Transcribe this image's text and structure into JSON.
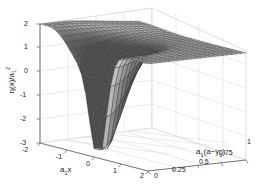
{
  "figure": {
    "kind": "3d-surface-plot",
    "background_color": "#ffffff",
    "grid_color": "#d9d9d9",
    "axis_color": "#808080",
    "mesh_color": "#3a3a3a",
    "surface_fill_light": "#e8e8e8",
    "surface_fill_dark": "#6e6e6e"
  },
  "chart_data": {
    "type": "surface",
    "title": "",
    "xlabel_parts": {
      "base": "a",
      "sub": "1",
      "tail": "x"
    },
    "xlabel": "a₁x",
    "ylabel": "η(x)/a₁²",
    "ylabel_parts": {
      "head": "η(x)/a",
      "sub": "1",
      "sup": "2"
    },
    "zlabel": "a₁(a−y₀)",
    "zlabel_parts": {
      "base": "a",
      "sub1": "1",
      "mid": "(a−y",
      "sub2": "0",
      "close": ")"
    },
    "xticks": [
      "-2",
      "-1",
      "0",
      "1",
      "2"
    ],
    "xlim": [
      -2,
      2
    ],
    "yticks": [
      "-3",
      "-2",
      "-1",
      "0",
      "1",
      "2"
    ],
    "ylim": [
      -3,
      2
    ],
    "zticks": [
      "0",
      "0.25",
      "0.5",
      "0.75",
      "1"
    ],
    "zlim": [
      0,
      1
    ],
    "grid": true,
    "legend": "none",
    "view": {
      "azimuth": -37.5,
      "elevation": 30
    },
    "z_min": -2.5,
    "z_max": 2.0,
    "trough_location": {
      "a1x": 0.1,
      "a1_a_minus_y0": 0.0
    },
    "plateau_value": 1.5
  }
}
